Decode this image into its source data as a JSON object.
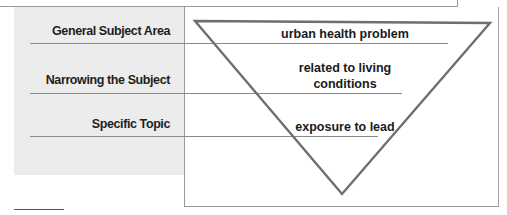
{
  "diagram": {
    "type": "inverted-triangle-funnel",
    "levels": [
      {
        "label": "General Subject Area",
        "content": "urban health problem"
      },
      {
        "label": "Narrowing the Subject",
        "content_lines": [
          "related to living",
          "conditions"
        ]
      },
      {
        "label": "Specific Topic",
        "content": "exposure to lead"
      }
    ]
  },
  "colors": {
    "panel": "#ececec",
    "triangle_stroke": "#6e6e6e",
    "rule": "#8a8a8a",
    "text": "#1e1e1e"
  }
}
